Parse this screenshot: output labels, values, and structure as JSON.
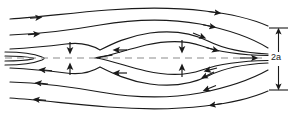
{
  "figure": {
    "name": "magnetic-island-streamline-diagram",
    "type": "flow-field-schematic",
    "width": 301,
    "height": 120,
    "background_color": "#ffffff",
    "stroke_color": "#1a1a1a",
    "axis_color": "#8c8c8c",
    "labels": {
      "half_width": "2a"
    },
    "axis": {
      "name": "symmetry-axis",
      "style": "dashed",
      "y": 58,
      "x_start": 5,
      "x_end": 262
    },
    "dimension_marker": {
      "name": "half-width-dimension",
      "label": "2a",
      "x": 278,
      "y_top": 28,
      "y_bottom": 90,
      "tick_half_width": 9
    },
    "streamlines": [
      {
        "name": "streamline-top-outer",
        "direction": "right",
        "region": "upper"
      },
      {
        "name": "streamline-top-inner",
        "direction": "right",
        "region": "upper"
      },
      {
        "name": "streamline-separatrix-upper",
        "direction": "right",
        "region": "upper"
      },
      {
        "name": "streamline-island-boundary-upper",
        "direction": "right",
        "region": "island"
      },
      {
        "name": "streamline-island-boundary-lower",
        "direction": "right",
        "region": "island"
      },
      {
        "name": "streamline-separatrix-lower",
        "direction": "left",
        "region": "lower"
      },
      {
        "name": "streamline-bottom-inner",
        "direction": "left",
        "region": "lower"
      },
      {
        "name": "streamline-bottom-outer",
        "direction": "left",
        "region": "lower"
      }
    ],
    "inflow_arrows": [
      {
        "name": "inflow-arrow-neck-upper",
        "orientation": "down",
        "x": 70,
        "y": 48
      },
      {
        "name": "inflow-arrow-neck-lower",
        "orientation": "up",
        "x": 70,
        "y": 69
      },
      {
        "name": "inflow-arrow-island-upper",
        "orientation": "down",
        "x": 182,
        "y": 46
      },
      {
        "name": "inflow-arrow-island-lower",
        "orientation": "up",
        "x": 182,
        "y": 71
      }
    ],
    "outflow_arrows": [
      {
        "name": "outflow-arrow-upper",
        "orientation": "left",
        "x": 120,
        "y": 50
      },
      {
        "name": "outflow-arrow-lower",
        "orientation": "left",
        "x": 120,
        "y": 73
      }
    ]
  }
}
